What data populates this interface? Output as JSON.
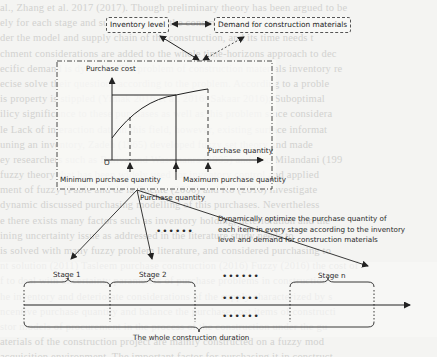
{
  "top_boxes": {
    "inventory_level": "Inventory level",
    "demand": "Demand for construction materials"
  },
  "chart": {
    "y_axis_label": "Purchase cost",
    "x_axis_label": "Purchase quantity",
    "origin_label": "O",
    "min_label": "Minimum purchase quantity",
    "max_label": "Maximum purchase quantity",
    "purchase_label": "Purchase quantity"
  },
  "annotation": {
    "line1": "Dynamically optimize the purchase quantity of",
    "line2": "each item in every stage according to the inventory",
    "line3": "level and demand for construction materials"
  },
  "stages": {
    "stage1": "Stage 1",
    "stage2": "Stage 2",
    "ellipsis": "••••••",
    "stagen": "Stage n"
  },
  "timeline": {
    "label": "The whole construction duration"
  },
  "background_text": [
    "al., Zhang et al. 2017 (2017). Though preliminary theory has been argued to be",
    "ely for each stage and supply chain of the construction material a lot",
    "der the model and supply chain of the construction, and its time needs t",
    "chment considerations are added to the whole time-horizons approach to dec",
    "ecific demand is dynamic. The problem of construction materials inventory re",
    "ecise solve their questions according to the problem. According to a proble",
    "is property is stippled (Yimak 2016 et al. 2016; Sakaar 2016); Suboptimal",
    "ilicy significance to these purchases as well as this problem since considera",
    "le Lack of interaction data in this field, however, existing surface informat",
    "uning an inventory, Zadeh (1965) developed fuzzy set theory and made",
    "ey researchers such as Ruliva and Wasemanrs (1995) and also Milandani (199",
    "fuzzy theory that has been widely used for inventory control and applied",
    "ment of fuzzy [Pable and de la Rochte (2000) and Ko (2016) investigate",
    "dynamic discussed purchasing modelling of this purchases. Nevertheless",
    "e there exists many factors such as inventory holding, deterioration and the",
    "ining uncertainty issue as addressed in the literature study needs to",
    "is solved with many fuzzy problem literature, and considered purchasing to",
    "nt solution (2011) Tasleem purchase construction (2016) Fuzzy (2016) the cost of",
    "f to deal with uncertainty parameters of purchase problems in construction",
    "he inventory and deteriorate considerations of the supply characterized by s",
    "ncentive purchase quantity and balance the purchase cost items of constructi",
    "stor models of procurement in the process of the construction under the gu",
    "aterials of the construction project are mainly constructed on a fuzzy mod",
    "acquisition environment. The important factor for purchasing it in construct",
    "eds in, the approach of the material purchasing problem in the construction proj"
  ]
}
